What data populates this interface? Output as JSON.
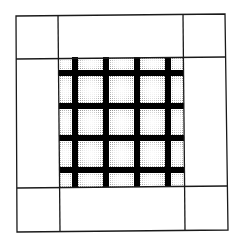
{
  "figure": {
    "outer_frame": {
      "x": 16,
      "y": 15,
      "width": 211,
      "height": 216
    },
    "center_square": {
      "x": 59,
      "y": 57,
      "width": 125,
      "height": 130
    },
    "bars": {
      "vertical_x": [
        72,
        103,
        134,
        165
      ],
      "horizontal_y": [
        70,
        103,
        135,
        167
      ],
      "thickness": 6
    },
    "colors": {
      "line": "#1a1a1a",
      "bar": "#000000",
      "cell_center": "#ffffff",
      "cell_edge": "#8a8a8a",
      "background": "#ffffff"
    }
  }
}
